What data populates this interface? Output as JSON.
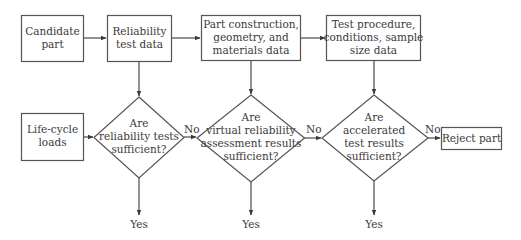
{
  "diagram": {
    "type": "flowchart",
    "nodes": {
      "candidate_part": {
        "shape": "rectangle",
        "lines": [
          "Candidate",
          "part"
        ]
      },
      "reliability_test_data": {
        "shape": "rectangle",
        "lines": [
          "Reliability",
          "test data"
        ]
      },
      "part_construction": {
        "shape": "rectangle",
        "lines": [
          "Part construction,",
          "geometry, and",
          "materials data"
        ]
      },
      "test_procedure": {
        "shape": "rectangle",
        "lines": [
          "Test procedure,",
          "conditions, sample",
          "size data"
        ]
      },
      "life_cycle_loads": {
        "shape": "rectangle",
        "lines": [
          "Life-cycle",
          "loads"
        ]
      },
      "decision_reliability_tests": {
        "shape": "diamond",
        "lines": [
          "Are",
          "reliability tests",
          "sufficient?"
        ]
      },
      "decision_virtual_assessment": {
        "shape": "diamond",
        "lines": [
          "Are",
          "virtual reliability",
          "assessment results",
          "sufficient?"
        ]
      },
      "decision_accelerated_tests": {
        "shape": "diamond",
        "lines": [
          "Are",
          "accelerated",
          "test results",
          "sufficient?"
        ]
      },
      "reject_part": {
        "shape": "rectangle",
        "lines": [
          "Reject part"
        ]
      }
    },
    "edge_labels": {
      "no_1": "No",
      "no_2": "No",
      "no_3": "No",
      "yes_1": "Yes",
      "yes_2": "Yes",
      "yes_3": "Yes"
    },
    "edges": [
      {
        "from": "candidate_part",
        "to": "reliability_test_data",
        "label": ""
      },
      {
        "from": "reliability_test_data",
        "to": "part_construction",
        "label": ""
      },
      {
        "from": "part_construction",
        "to": "test_procedure",
        "label": ""
      },
      {
        "from": "reliability_test_data",
        "to": "decision_reliability_tests",
        "label": ""
      },
      {
        "from": "part_construction",
        "to": "decision_virtual_assessment",
        "label": ""
      },
      {
        "from": "test_procedure",
        "to": "decision_accelerated_tests",
        "label": ""
      },
      {
        "from": "life_cycle_loads",
        "to": "decision_reliability_tests",
        "label": ""
      },
      {
        "from": "decision_reliability_tests",
        "to": "decision_virtual_assessment",
        "label": "No"
      },
      {
        "from": "decision_virtual_assessment",
        "to": "decision_accelerated_tests",
        "label": "No"
      },
      {
        "from": "decision_accelerated_tests",
        "to": "reject_part",
        "label": "No"
      },
      {
        "from": "decision_reliability_tests",
        "to": "yes_1",
        "label": "Yes"
      },
      {
        "from": "decision_virtual_assessment",
        "to": "yes_2",
        "label": "Yes"
      },
      {
        "from": "decision_accelerated_tests",
        "to": "yes_3",
        "label": "Yes"
      }
    ]
  }
}
